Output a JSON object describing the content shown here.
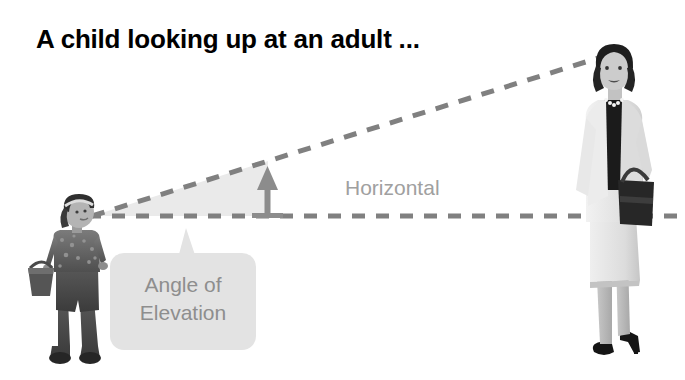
{
  "slide": {
    "title": "A child looking up at an adult ...",
    "background_color": "#ffffff"
  },
  "diagram": {
    "horizontal_label": "Horizontal",
    "callout": {
      "line1": "Angle of",
      "line2": "Elevation",
      "fill_color": "#e3e3e3",
      "text_color": "#8e8e8e"
    },
    "line_of_sight": {
      "name": "line-of-sight-dashed",
      "style": "dashed",
      "color": "#808080",
      "from": [
        92,
        216
      ],
      "to": [
        600,
        58
      ]
    },
    "horizontal_line": {
      "name": "horizontal-dashed",
      "style": "dashed",
      "color": "#808080",
      "from": [
        90,
        216
      ],
      "to": [
        685,
        216
      ]
    },
    "angle_wedge": {
      "fill_color": "#eaeaea",
      "vertex": [
        92,
        216
      ]
    },
    "height_arrow": {
      "name": "vertical-arrow",
      "color": "#8c8c8c",
      "from": [
        268,
        216
      ],
      "to": [
        268,
        174
      ]
    }
  },
  "figures": {
    "child": {
      "label": "child-photo",
      "description": "grayscale photo of a child holding a basket, looking up"
    },
    "adult": {
      "label": "adult-photo",
      "description": "grayscale photo of a woman in a light suit holding a handbag"
    }
  },
  "colors": {
    "dash_gray": "#808080",
    "wedge_gray": "#eaeaea",
    "label_gray": "#a0a0a0",
    "callout_gray": "#e3e3e3",
    "title_black": "#000000"
  }
}
